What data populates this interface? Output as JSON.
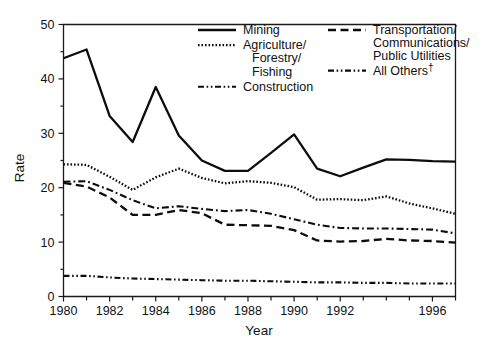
{
  "chart_data": {
    "type": "line",
    "title": "",
    "xlabel": "Year",
    "ylabel": "Rate",
    "xlim": [
      1980,
      1997
    ],
    "ylim": [
      0,
      50
    ],
    "yticks": [
      0,
      10,
      20,
      30,
      40,
      50
    ],
    "ytick_labels": [
      "0",
      "10",
      "20",
      "30",
      "40",
      "50"
    ],
    "xticks": [
      1980,
      1981,
      1982,
      1983,
      1984,
      1985,
      1986,
      1987,
      1988,
      1989,
      1990,
      1991,
      1992,
      1993,
      1994,
      1995,
      1996,
      1997
    ],
    "xtick_labels_shown": [
      "1980",
      "1982",
      "1984",
      "1986",
      "1988",
      "1990",
      "1992",
      "1996"
    ],
    "xtick_label_years": [
      1980,
      1982,
      1984,
      1986,
      1988,
      1990,
      1992,
      1996
    ],
    "grid": false,
    "legend_position": "top-center-inside",
    "x": [
      1980,
      1981,
      1982,
      1983,
      1984,
      1985,
      1986,
      1987,
      1988,
      1989,
      1990,
      1991,
      1992,
      1993,
      1994,
      1995,
      1996,
      1997
    ],
    "series": [
      {
        "name": "Mining",
        "style": "solid",
        "values": [
          43.8,
          45.4,
          33.2,
          28.4,
          38.5,
          29.6,
          25.0,
          23.1,
          23.1,
          26.4,
          29.8,
          23.5,
          22.1,
          23.7,
          25.2,
          25.1,
          24.9,
          24.8
        ]
      },
      {
        "name": "Agriculture/ Forestry/ Fishing",
        "style": "dotted",
        "values": [
          24.3,
          24.2,
          22.0,
          19.6,
          21.9,
          23.5,
          21.8,
          20.8,
          21.2,
          20.9,
          20.1,
          17.8,
          17.9,
          17.7,
          18.4,
          17.1,
          16.2,
          15.2
        ]
      },
      {
        "name": "Construction",
        "style": "dash-dot",
        "values": [
          21.1,
          21.2,
          19.6,
          17.7,
          16.2,
          16.6,
          16.1,
          15.7,
          15.9,
          15.2,
          14.2,
          13.2,
          12.6,
          12.5,
          12.5,
          12.4,
          12.3,
          11.6
        ]
      },
      {
        "name": "Transportation/ Communications/ Public Utilities",
        "style": "dashed",
        "values": [
          20.9,
          20.2,
          18.2,
          15.0,
          15.0,
          15.9,
          15.3,
          13.2,
          13.1,
          13.0,
          12.2,
          10.3,
          10.1,
          10.2,
          10.6,
          10.3,
          10.2,
          9.9
        ]
      },
      {
        "name": "All Others",
        "style": "dash-dot-dot",
        "values": [
          3.8,
          3.8,
          3.5,
          3.3,
          3.2,
          3.1,
          3.0,
          2.9,
          2.9,
          2.8,
          2.7,
          2.6,
          2.6,
          2.5,
          2.5,
          2.4,
          2.4,
          2.4
        ]
      }
    ]
  },
  "legend": {
    "items": [
      {
        "label": "Mining",
        "style": "solid",
        "column": "left"
      },
      {
        "label": "Agriculture/",
        "label_line2": "Forestry/",
        "label_line3": "Fishing",
        "style": "dotted",
        "column": "left"
      },
      {
        "label": "Construction",
        "style": "dash-dot-dot",
        "column": "left"
      },
      {
        "label": "Transportation/",
        "label_line2": "Communications/",
        "label_line3": "Public Utilities",
        "style": "dashed",
        "column": "right"
      },
      {
        "label": "All Others",
        "suffix": "†",
        "style": "dash-dot-dot",
        "column": "right"
      }
    ]
  },
  "axes": {
    "y_title": "Rate",
    "x_title": "Year",
    "y_tick_labels": [
      "50",
      "40",
      "30",
      "20",
      "10",
      "0"
    ],
    "x_tick_labels": [
      "1980",
      "1982",
      "1984",
      "1986",
      "1988",
      "1990",
      "1992",
      "1996"
    ]
  },
  "colors": {
    "line": "#0d0d0d",
    "axis": "#1a1a1a",
    "background": "#ffffff"
  }
}
